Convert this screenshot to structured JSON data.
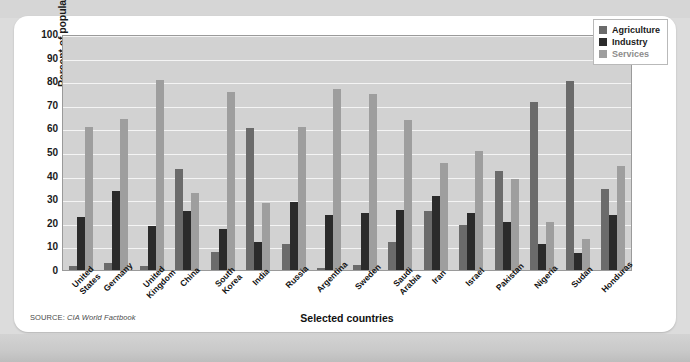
{
  "chart_data": {
    "type": "bar",
    "title": "",
    "xlabel": "Selected countries",
    "ylabel": "Percent of population",
    "ylim": [
      0,
      100
    ],
    "ytick_step": 10,
    "yticks": [
      100,
      90,
      80,
      70,
      60,
      50,
      40,
      30,
      20,
      10,
      0
    ],
    "grid": true,
    "legend_position": "top-right",
    "categories": [
      "United States",
      "Germany",
      "United Kingdom",
      "China",
      "South Korea",
      "India",
      "Russia",
      "Argentina",
      "Sweden",
      "Saudi Arabia",
      "Iran",
      "Israel",
      "Pakistan",
      "Nigeria",
      "Sudan",
      "Honduras"
    ],
    "series": [
      {
        "name": "Agriculture",
        "color": "#6b6b6b",
        "values": [
          1.5,
          2.8,
          1.5,
          43,
          7.5,
          60,
          11,
          1,
          2,
          12,
          25,
          19,
          42,
          71,
          80,
          34.5
        ]
      },
      {
        "name": "Industry",
        "color": "#2b2b2b",
        "values": [
          22.5,
          33.5,
          18.5,
          25,
          17.5,
          12,
          29,
          23.5,
          24,
          25.5,
          31.5,
          24,
          20.5,
          11,
          7,
          23.5
        ]
      },
      {
        "name": "Services",
        "color": "#9e9e9e",
        "values": [
          60.5,
          64,
          80.5,
          32.5,
          75.5,
          28.5,
          60.5,
          76.5,
          74.5,
          63.5,
          45.5,
          50.5,
          38.5,
          20.5,
          13,
          44
        ]
      }
    ]
  },
  "legend": {
    "items": [
      {
        "label": "Agriculture",
        "key": "agriculture"
      },
      {
        "label": "Industry",
        "key": "industry"
      },
      {
        "label": "Services",
        "key": "services"
      }
    ]
  },
  "source": {
    "label": "SOURCE:",
    "value": "CIA World Factbook"
  },
  "colors": {
    "agriculture": "#6b6b6b",
    "industry": "#2b2b2b",
    "services": "#9e9e9e",
    "plot_background": "#d2d2d2",
    "gridline": "#f4f4f4",
    "card_background": "#ffffff",
    "page_background": "#dcdcdc"
  }
}
